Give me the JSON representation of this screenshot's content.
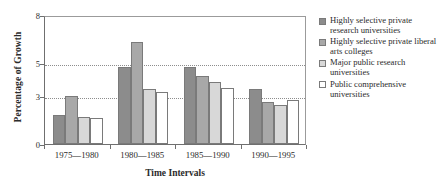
{
  "chart_data": {
    "type": "bar",
    "title": "",
    "xlabel": "Time Intervals",
    "ylabel": "Percentage of Growth",
    "categories": [
      "1975—1980",
      "1980—1985",
      "1985—1990",
      "1990—1995"
    ],
    "ylim": [
      0,
      8
    ],
    "ytick_labels": [
      "0",
      "3",
      "5",
      "8"
    ],
    "ytick_values": [
      0,
      3,
      5,
      8
    ],
    "gridlines": [
      3,
      5
    ],
    "grid": true,
    "legend_position": "right",
    "series": [
      {
        "name": "Highly selective private research universities",
        "color": "#8c8c8c",
        "values": [
          1.8,
          4.75,
          4.75,
          3.4
        ]
      },
      {
        "name": "Highly selective private liberal arts colleges",
        "color": "#a8a8a8",
        "values": [
          3.0,
          6.3,
          4.2,
          2.6
        ]
      },
      {
        "name": "Major public research universities",
        "color": "#d8d8d8",
        "values": [
          1.7,
          3.4,
          3.85,
          2.45
        ]
      },
      {
        "name": "Public comprehensive universities",
        "color": "#ffffff",
        "values": [
          1.6,
          3.25,
          3.5,
          2.7
        ]
      }
    ]
  },
  "legend": {
    "entries": [
      {
        "line1": "Highly selective private",
        "line2": "research universities"
      },
      {
        "line1": "Highly selective private",
        "line2": "liberal arts colleges"
      },
      {
        "line1": "Major public research",
        "line2": "universities"
      },
      {
        "line1": "Public comprehensive",
        "line2": "universities"
      }
    ]
  }
}
